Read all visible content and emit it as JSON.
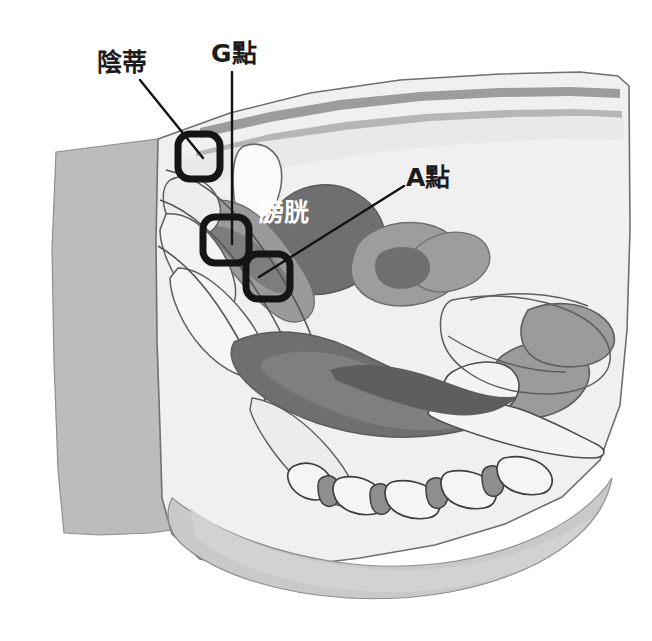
{
  "figure": {
    "kind": "anatomical-illustration",
    "view": "female pelvis mid-sagittal cross-section",
    "style": "grayscale line drawing with flat gray fills",
    "background_color": "#ffffff",
    "canvas": {
      "width": 652,
      "height": 641
    }
  },
  "labels": {
    "clitoris": {
      "text": "陰蒂",
      "color": "#1c1c1c",
      "x": 97,
      "y": 50
    },
    "gspot": {
      "text": "G點",
      "color": "#1c1c1c",
      "x": 211,
      "y": 41
    },
    "aspot": {
      "text": "A點",
      "color": "#1c1c1c",
      "x": 406,
      "y": 165
    },
    "bladder": {
      "text": "膀胱",
      "color": "#ffffff",
      "x": 259,
      "y": 200
    }
  },
  "callout_boxes": [
    {
      "name": "clitoris-box",
      "x": 178,
      "y": 134,
      "width": 42,
      "height": 45,
      "stroke": "#151515",
      "stroke_width": 7,
      "corner_radius": 12
    },
    {
      "name": "gspot-box",
      "x": 203,
      "y": 217,
      "width": 46,
      "height": 46,
      "stroke": "#151515",
      "stroke_width": 7,
      "corner_radius": 12
    },
    {
      "name": "aspot-box",
      "x": 246,
      "y": 254,
      "width": 44,
      "height": 45,
      "stroke": "#151515",
      "stroke_width": 7,
      "corner_radius": 12
    }
  ],
  "leader_lines": [
    {
      "name": "clitoris-leader",
      "from_x": 140,
      "from_y": 80,
      "to_x": 203,
      "to_y": 158,
      "stroke": "#131313",
      "stroke_width": 2.4
    },
    {
      "name": "gspot-leader",
      "from_x": 232,
      "from_y": 72,
      "to_x": 232,
      "to_y": 244,
      "stroke": "#131313",
      "stroke_width": 2.4
    },
    {
      "name": "aspot-leader",
      "from_x": 404,
      "from_y": 186,
      "to_x": 259,
      "to_y": 277,
      "stroke": "#131313",
      "stroke_width": 2.4
    }
  ],
  "palette": {
    "paper": "#ffffff",
    "body_pale": "#efefef",
    "tissue_light": "#e3e3e3",
    "tissue_mid": "#c9c9c9",
    "tissue_gray": "#b4b4b4",
    "muscle_gray": "#9a9a9a",
    "organ_dark": "#6f6f6f",
    "organ_darker": "#5e5e5e",
    "outline": "#555555",
    "outline_dark": "#3a3a3a",
    "ink": "#1c1c1c"
  },
  "regions": [
    {
      "name": "thigh-block-left",
      "fill": "#b9b9b9"
    },
    {
      "name": "abdominal-wall",
      "fill": "#efefef"
    },
    {
      "name": "skin-line-upper",
      "fill": "#9a9a9a"
    },
    {
      "name": "skin-line-lower",
      "fill": "#b0b0b0"
    },
    {
      "name": "bladder",
      "fill": "#6f6f6f"
    },
    {
      "name": "uterus",
      "fill": "#9d9d9d"
    },
    {
      "name": "uterus-cavity",
      "fill": "#6f6f6f"
    },
    {
      "name": "pubic-bone",
      "fill": "#ffffff"
    },
    {
      "name": "vaginal-canal",
      "fill": "#9a9a9a"
    },
    {
      "name": "rectum",
      "fill": "#6f6f6f"
    },
    {
      "name": "sacrum",
      "fill": "#f2f2f2"
    },
    {
      "name": "coccyx-vertebrae",
      "fill": "#f4f4f4"
    },
    {
      "name": "intervertebral-disc",
      "fill": "#8e8e8e"
    },
    {
      "name": "buttock",
      "fill": "#c9c9c9"
    }
  ]
}
